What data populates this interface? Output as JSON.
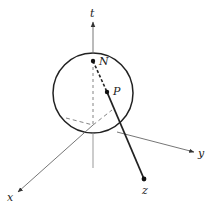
{
  "diagram": {
    "type": "stereographic-projection",
    "labels": {
      "t": "t",
      "N": "N",
      "P": "P",
      "x": "x",
      "y": "y",
      "z": "z"
    },
    "colors": {
      "stroke": "#222222",
      "axis": "#555555",
      "background": "#ffffff"
    }
  }
}
